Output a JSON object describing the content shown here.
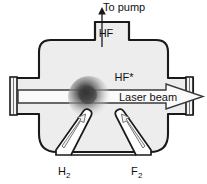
{
  "figure": {
    "background_color": "#ffffff",
    "outline_color": "#1a1a1a",
    "body_fill": "#ededed",
    "arrow_fill": "#fafafa",
    "glow_color": "#2b2b2b"
  },
  "labels": {
    "to_pump": "To  pump",
    "hf": "HF",
    "hf_excited": "HF*",
    "laser_beam": "Laser  beam",
    "hydrogen": "H",
    "hydrogen_sub": "2",
    "fluorine": "F",
    "fluorine_sub": "2"
  },
  "parts": {
    "chamber": "reaction-chamber",
    "top_neck": "pump-exhaust-neck",
    "left_arm": "left-optical-arm",
    "right_arm": "right-optical-arm",
    "left_window": "left-laser-window",
    "right_window": "right-laser-window",
    "glow": "reaction-zone-glow",
    "nozzle_left": "hydrogen-inlet-nozzle",
    "nozzle_right": "fluorine-inlet-nozzle",
    "pump_arrow": "to-pump-arrow",
    "beam_arrow": "laser-beam-arrow"
  }
}
